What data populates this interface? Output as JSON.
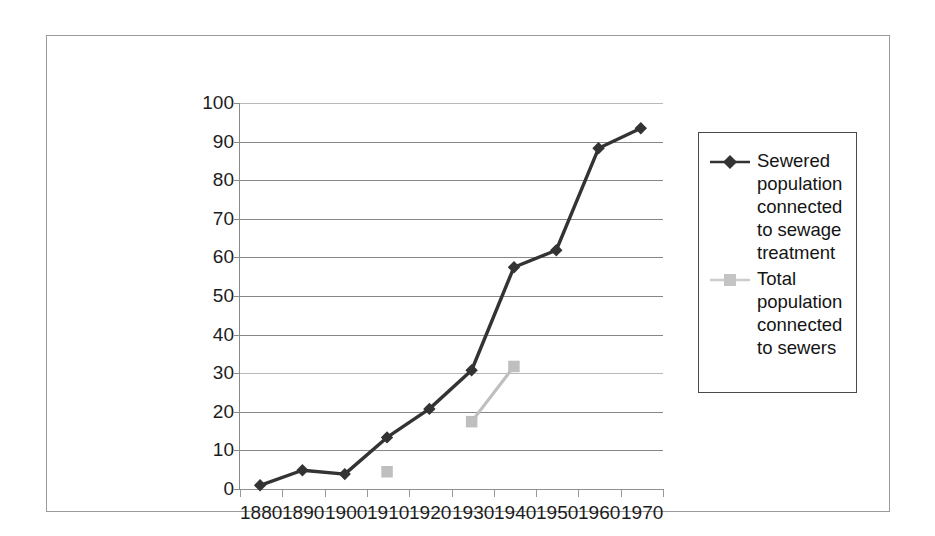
{
  "chart_data": {
    "type": "line",
    "title": "",
    "subtitle": "",
    "xlabel": "",
    "ylabel": "",
    "categories": [
      "1880",
      "1890",
      "1900",
      "1910",
      "1920",
      "1930",
      "1940",
      "1950",
      "1960",
      "1970"
    ],
    "ylim": [
      0,
      100
    ],
    "yticks": [
      0,
      10,
      20,
      30,
      40,
      50,
      60,
      70,
      80,
      90,
      100
    ],
    "ytick_labels": [
      "0",
      "10",
      "20",
      "30",
      "40",
      "50",
      "60",
      "70",
      "80",
      "90",
      "100"
    ],
    "grid": true,
    "legend_position": "right",
    "series": [
      {
        "name": "Sewered population connected to sewage treatment",
        "color": "#333333",
        "marker": "diamond",
        "values": [
          0.7,
          4.6,
          3.6,
          13.1,
          20.5,
          30.5,
          57.2,
          61.6,
          88.0,
          93.2
        ]
      },
      {
        "name": "Total population connected to sewers",
        "color": "#bfbfbf",
        "marker": "square",
        "values": [
          null,
          null,
          null,
          4.2,
          null,
          17.2,
          31.5,
          null,
          null,
          null
        ]
      }
    ]
  },
  "legend": {
    "entries": [
      {
        "label": "Sewered population connected to sewage treatment",
        "marker": "diamond-marker",
        "color": "#333333"
      },
      {
        "label": "Total population connected to sewers",
        "marker": "square-marker",
        "color": "#bfbfbf"
      }
    ]
  },
  "colors": {
    "series_dark": "#333333",
    "series_light": "#bfbfbf",
    "gridline": "#868686",
    "axis": "#8a8a8a",
    "frame": "#9a9a9a",
    "text": "#1c1c1c",
    "background": "#ffffff"
  }
}
